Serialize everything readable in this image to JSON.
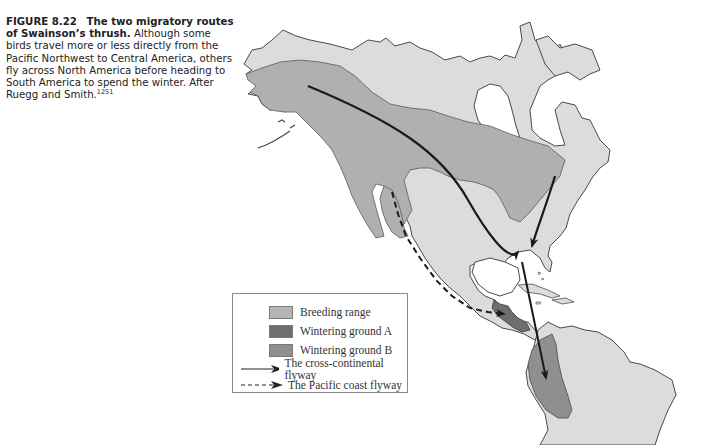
{
  "caption": {
    "figure_label": "FIGURE 8.22",
    "title": "The two migratory routes of Swainson’s thrush.",
    "body": "Although some birds travel more or less directly from the Pacific Northwest to Central America, others fly across North America before heading to South America to spend the winter. After Ruegg and Smith.",
    "reference": "1251"
  },
  "legend": {
    "items": [
      {
        "label": "Breeding range",
        "color": "#b5b5b5"
      },
      {
        "label": "Wintering ground A",
        "color": "#6e6e6e"
      },
      {
        "label": "Wintering ground B",
        "color": "#8f8f8f"
      }
    ],
    "lines": [
      {
        "label": "The cross-continental flyway",
        "style": "solid"
      },
      {
        "label": "The Pacific coast flyway",
        "style": "dashed"
      }
    ]
  },
  "colors": {
    "land": "#dcdcdc",
    "breeding": "#b0b0b0",
    "wintering_a": "#6e6e6e",
    "wintering_b": "#8f8f8f",
    "coast": "#4a4a4a",
    "route": "#1a1a1a"
  },
  "map_labels": {
    "regions": [
      "North America",
      "Central America",
      "South America"
    ],
    "species": "Swainson’s thrush"
  }
}
